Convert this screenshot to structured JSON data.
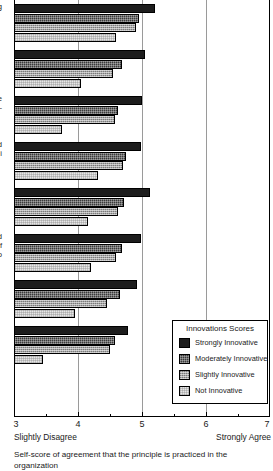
{
  "chart_data": {
    "type": "bar",
    "orientation": "horizontal",
    "title": "",
    "caption": "Self-score of agreement that the principle is practiced in the organization",
    "xlabel": "",
    "ylabel": "",
    "xlim": [
      3,
      7
    ],
    "xticks": [
      3,
      4,
      5,
      6,
      7
    ],
    "xtick_labels": [
      "3",
      "4",
      "5",
      "6",
      "7"
    ],
    "x_anchor_low": "Slightly Disagree",
    "x_anchor_high": "Strongly Agree",
    "grid": true,
    "grid_axis": "x",
    "legend_position": "lower-right",
    "legend_title": "Innovations Scores",
    "series": [
      {
        "name": "Strongly Innovative",
        "fill": "f0",
        "color": "#1d1d1d",
        "values": [
          5.2,
          5.05,
          5.0,
          4.98,
          5.12,
          4.98,
          4.92,
          4.78
        ]
      },
      {
        "name": "Moderately Innovative",
        "fill": "f1",
        "color": "#3a3a3a",
        "values": [
          4.95,
          4.68,
          4.62,
          4.75,
          4.72,
          4.68,
          4.65,
          4.58
        ]
      },
      {
        "name": "Slightly Innovative",
        "fill": "f2",
        "color": "#a6a6a6",
        "values": [
          4.9,
          4.55,
          4.58,
          4.7,
          4.62,
          4.6,
          4.46,
          4.5
        ]
      },
      {
        "name": "Not Innovative",
        "fill": "f3",
        "color": "#e6e6e6",
        "values": [
          4.6,
          4.05,
          3.75,
          4.32,
          4.15,
          4.2,
          3.95,
          3.45
        ]
      }
    ],
    "categories": [
      "g",
      "",
      "re\ni-",
      "d\ni",
      "",
      "ed\nf\no",
      "",
      ""
    ]
  },
  "legend": {
    "title": "Innovations Scores",
    "items": [
      {
        "label": "Strongly Innovative"
      },
      {
        "label": "Moderately Innovative"
      },
      {
        "label": "Slightly Innovative"
      },
      {
        "label": "Not Innovative"
      }
    ]
  },
  "axis": {
    "tick_labels": [
      "3",
      "4",
      "5",
      "6",
      "7"
    ],
    "anchor_low": "Slightly Disagree",
    "anchor_high": "Strongly Agree"
  },
  "caption": {
    "text": "Self-score of agreement that the principle is practiced in the organization"
  }
}
